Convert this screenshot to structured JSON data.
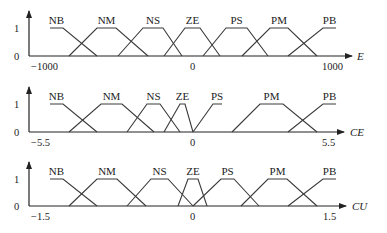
{
  "panels": [
    {
      "axis_label": "E",
      "ticks": {
        "min": "−1000",
        "zero": "0",
        "max": "1000",
        "one": "1",
        "origin": "0"
      },
      "sets": [
        {
          "name": "NB",
          "pts": [
            [
              50,
              28
            ],
            [
              63,
              28
            ],
            [
              97,
              56
            ]
          ]
        },
        {
          "name": "NM",
          "pts": [
            [
              69,
              56
            ],
            [
              97,
              28
            ],
            [
              116,
              28
            ],
            [
              148,
              56
            ]
          ]
        },
        {
          "name": "NS",
          "pts": [
            [
              118,
              56
            ],
            [
              143,
              28
            ],
            [
              163,
              28
            ],
            [
              182,
              56
            ]
          ]
        },
        {
          "name": "ZE",
          "pts": [
            [
              164,
              56
            ],
            [
              185,
              28
            ],
            [
              200,
              28
            ],
            [
              220,
              56
            ]
          ]
        },
        {
          "name": "PS",
          "pts": [
            [
              203,
              56
            ],
            [
              226,
              28
            ],
            [
              247,
              28
            ],
            [
              268,
              56
            ]
          ]
        },
        {
          "name": "PM",
          "pts": [
            [
              242,
              56
            ],
            [
              270,
              28
            ],
            [
              288,
              28
            ],
            [
              317,
              56
            ]
          ]
        },
        {
          "name": "PB",
          "pts": [
            [
              288,
              56
            ],
            [
              323,
              28
            ],
            [
              336,
              28
            ]
          ]
        }
      ]
    },
    {
      "axis_label": "CE",
      "ticks": {
        "min": "−5.5",
        "zero": "0",
        "max": "5.5",
        "one": "1",
        "origin": "0"
      },
      "sets": [
        {
          "name": "NB",
          "pts": [
            [
              50,
              104
            ],
            [
              63,
              104
            ],
            [
              97,
              132
            ]
          ]
        },
        {
          "name": "NM",
          "pts": [
            [
              69,
              132
            ],
            [
              101,
              104
            ],
            [
              122,
              104
            ],
            [
              154,
              132
            ]
          ]
        },
        {
          "name": "NS",
          "pts": [
            [
              127,
              132
            ],
            [
              147,
              104
            ],
            [
              160,
              104
            ],
            [
              180,
              132
            ]
          ]
        },
        {
          "name": "ZE",
          "pts": [
            [
              164,
              132
            ],
            [
              180,
              104
            ],
            [
              185,
              104
            ],
            [
              193,
              132
            ]
          ]
        },
        {
          "name": "PS",
          "pts": [
            [
              193,
              132
            ],
            [
              213,
              104
            ],
            [
              222,
              104
            ],
            [
              221,
              104
            ],
            [
              221,
              104
            ],
            [
              221,
              104
            ]
          ]
        },
        {
          "name": "PM",
          "pts": [
            [
              232,
              132
            ],
            [
              260,
              104
            ],
            [
              283,
              104
            ],
            [
              317,
              132
            ]
          ]
        },
        {
          "name": "PB",
          "pts": [
            [
              288,
              132
            ],
            [
              323,
              104
            ],
            [
              336,
              104
            ]
          ]
        }
      ]
    },
    {
      "axis_label": "CU",
      "ticks": {
        "min": "−1.5",
        "zero": "0",
        "max": "1.5",
        "one": "1",
        "origin": "0"
      },
      "sets": [
        {
          "name": "NB",
          "pts": [
            [
              50,
              179
            ],
            [
              63,
              179
            ],
            [
              97,
              206
            ]
          ]
        },
        {
          "name": "NM",
          "pts": [
            [
              69,
              206
            ],
            [
              97,
              179
            ],
            [
              117,
              179
            ],
            [
              146,
              206
            ]
          ]
        },
        {
          "name": "NS",
          "pts": [
            [
              127,
              206
            ],
            [
              151,
              179
            ],
            [
              168,
              179
            ],
            [
              193,
              206
            ]
          ]
        },
        {
          "name": "ZE",
          "pts": [
            [
              178,
              206
            ],
            [
              188,
              179
            ],
            [
              198,
              179
            ],
            [
              207,
              206
            ]
          ]
        },
        {
          "name": "PS",
          "pts": [
            [
              193,
              206
            ],
            [
              221,
              179
            ],
            [
              234,
              179
            ],
            [
              259,
              206
            ]
          ]
        },
        {
          "name": "PM",
          "pts": [
            [
              241,
              206
            ],
            [
              268,
              179
            ],
            [
              287,
              179
            ],
            [
              317,
              206
            ]
          ]
        },
        {
          "name": "PB",
          "pts": [
            [
              288,
              206
            ],
            [
              323,
              179
            ],
            [
              336,
              179
            ]
          ]
        }
      ]
    }
  ]
}
